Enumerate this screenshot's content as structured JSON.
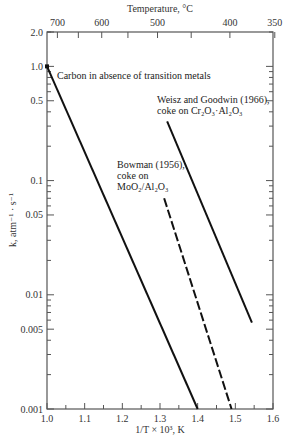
{
  "chart_data": {
    "type": "line",
    "title": "",
    "xlabel": "1/T × 10³, K",
    "ylabel": "k, atm⁻¹ · s⁻¹",
    "top_xlabel": "Temperature, °C",
    "xlim": [
      1.0,
      1.6
    ],
    "ylim": [
      0.001,
      2.0
    ],
    "yscale": "log",
    "grid": false,
    "legend": "none (inline annotations)",
    "x_ticks": [
      1.0,
      1.1,
      1.2,
      1.3,
      1.4,
      1.5,
      1.6
    ],
    "x_tick_labels": [
      "1.0",
      "1.1",
      "1.2",
      "1.3",
      "1.4",
      "1.5",
      "1.6"
    ],
    "y_tick_labels": [
      {
        "value": 2.0,
        "label": "2.0"
      },
      {
        "value": 1.0,
        "label": "1.0"
      },
      {
        "value": 0.5,
        "label": "0.5"
      },
      {
        "value": 0.1,
        "label": "0.1"
      },
      {
        "value": 0.05,
        "label": "0.05"
      },
      {
        "value": 0.01,
        "label": "0.01"
      },
      {
        "value": 0.005,
        "label": "0.005"
      },
      {
        "value": 0.001,
        "label": "0.001"
      }
    ],
    "top_ticks": [
      {
        "temp_c": 700,
        "label": "700"
      },
      {
        "temp_c": 650,
        "label": ""
      },
      {
        "temp_c": 600,
        "label": "600"
      },
      {
        "temp_c": 550,
        "label": ""
      },
      {
        "temp_c": 500,
        "label": "500"
      },
      {
        "temp_c": 450,
        "label": ""
      },
      {
        "temp_c": 400,
        "label": "400"
      },
      {
        "temp_c": 350,
        "label": "350"
      }
    ],
    "series": [
      {
        "name": "Carbon in absence of transition metals",
        "style": "solid",
        "points": [
          {
            "x": 1.0,
            "y": 1.0
          },
          {
            "x": 1.4,
            "y": 0.001
          }
        ],
        "label_lines": [
          "Carbon in absence of transition metals"
        ]
      },
      {
        "name": "Weisz and Goodwin (1966), coke on Cr2O3·Al2O3",
        "style": "solid",
        "points": [
          {
            "x": 1.319,
            "y": 0.33
          },
          {
            "x": 1.544,
            "y": 0.0057
          }
        ],
        "label_lines": [
          "Weisz and Goodwin (1966),",
          "coke on Cr₂O₃·Al₂O₃"
        ]
      },
      {
        "name": "Bowman (1956), coke on MoO2/Al2O3",
        "style": "dashed",
        "points": [
          {
            "x": 1.311,
            "y": 0.07
          },
          {
            "x": 1.49,
            "y": 0.001
          }
        ],
        "label_lines": [
          "Bowman (1956),",
          "coke on",
          "MoO₂/Al₂O₃"
        ]
      }
    ]
  },
  "plot_box": {
    "left": 47,
    "top": 32,
    "right": 273,
    "bottom": 409
  }
}
